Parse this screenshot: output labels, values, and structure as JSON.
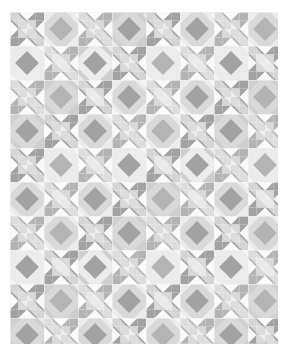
{
  "artwork": {
    "title": "Patchwork Quilt Pattern",
    "kind": "quilt-pattern",
    "style": "ohio-star-and-square-in-square",
    "canvas": {
      "width": 288,
      "height": 357,
      "background": "#ffffff"
    },
    "quilt_area": {
      "x": 10,
      "y": 12,
      "width": 268,
      "height": 332
    },
    "grid": {
      "block_size": 34,
      "cells_per_block": 4,
      "cell_size": 8.5,
      "blocks_across": 8,
      "blocks_down": 10,
      "repeat_period": 68
    },
    "palette": {
      "white": "#fafafa",
      "pale": "#ececec",
      "light": "#d9d9d9",
      "light_mid": "#cfcfcf",
      "mid": "#b4b4b4",
      "mid_dark": "#a2a2a2",
      "dark": "#949494",
      "background": "#ffffff"
    },
    "palette_labels": [
      "white",
      "pale",
      "light",
      "light mid",
      "mid",
      "mid dark",
      "dark"
    ],
    "block_types": [
      {
        "name": "star-block",
        "description": "eight-pointed star with four-patch center"
      },
      {
        "name": "square-in-square-block",
        "description": "on-point square framed by triangles"
      }
    ],
    "seam_line_color": "#f2f2f2",
    "seam_line_width": 0.6
  },
  "chart_data": {
    "type": "heatmap",
    "xlabel": "",
    "ylabel": "",
    "note": "Two alternating 4x4 pieced blocks tiled 8 across by 10 down",
    "categories": [
      "star-block",
      "square-in-square-block"
    ],
    "values": [
      8,
      10
    ]
  }
}
